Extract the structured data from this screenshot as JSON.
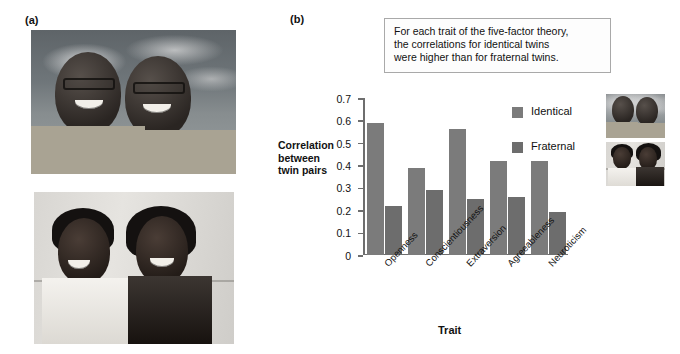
{
  "panels": {
    "a": {
      "label": "(a)"
    },
    "b": {
      "label": "(b)"
    }
  },
  "photos": {
    "identical": {
      "name": "identical-twins-photo",
      "alt": "Two identical twin men smiling in plaid shirts against a cloudy sky"
    },
    "fraternal": {
      "name": "fraternal-twins-photo",
      "alt": "A young man and young woman, fraternal twins, smiling against a light wall"
    }
  },
  "caption": {
    "line1": "For each trait of the five-factor theory,",
    "line2": "the correlations for identical twins",
    "line3": "were higher than for fraternal twins."
  },
  "legend": {
    "identical": "Identical",
    "fraternal": "Fraternal",
    "identical_color": "#7b7b7b",
    "fraternal_color": "#6d6d6d"
  },
  "axis": {
    "ylabel_line1": "Correlation",
    "ylabel_line2": "between",
    "ylabel_line3": "twin pairs",
    "xlabel": "Trait",
    "yticks": [
      "0",
      "0.1",
      "0.2",
      "0.3",
      "0.4",
      "0.5",
      "0.6",
      "0.7"
    ]
  },
  "chart_data": {
    "type": "bar",
    "title": "",
    "categories": [
      "Openness",
      "Conscientiousness",
      "Extraversion",
      "Agreeableness",
      "Neuroticism"
    ],
    "series": [
      {
        "name": "Identical",
        "values": [
          0.59,
          0.39,
          0.56,
          0.42,
          0.42
        ],
        "color": "#7b7b7b"
      },
      {
        "name": "Fraternal",
        "values": [
          0.22,
          0.29,
          0.25,
          0.26,
          0.19
        ],
        "color": "#6d6d6d"
      }
    ],
    "xlabel": "Trait",
    "ylabel": "Correlation between twin pairs",
    "ylim": [
      0,
      0.7
    ],
    "ytick_step": 0.1,
    "grid": false,
    "legend_position": "upper-right"
  }
}
